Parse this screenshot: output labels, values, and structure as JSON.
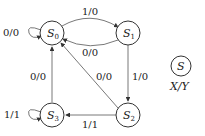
{
  "diagram": {
    "type": "state-diagram",
    "states": [
      {
        "id": "S0",
        "label": "S",
        "sub": "0"
      },
      {
        "id": "S1",
        "label": "S",
        "sub": "1"
      },
      {
        "id": "S2",
        "label": "S",
        "sub": "2"
      },
      {
        "id": "S3",
        "label": "S",
        "sub": "3"
      }
    ],
    "transitions": [
      {
        "from": "S0",
        "to": "S0",
        "label": "0/0"
      },
      {
        "from": "S0",
        "to": "S1",
        "label": "1/0"
      },
      {
        "from": "S1",
        "to": "S0",
        "label": "0/0"
      },
      {
        "from": "S1",
        "to": "S2",
        "label": "1/0"
      },
      {
        "from": "S2",
        "to": "S0",
        "label": "0/0"
      },
      {
        "from": "S2",
        "to": "S3",
        "label": "1/1"
      },
      {
        "from": "S3",
        "to": "S0",
        "label": "0/0"
      },
      {
        "from": "S3",
        "to": "S3",
        "label": "1/1"
      }
    ],
    "legend": {
      "state": "S",
      "io": "X/Y"
    }
  }
}
